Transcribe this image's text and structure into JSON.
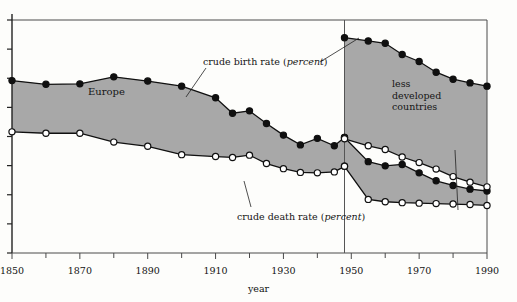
{
  "chart_data": {
    "type": "area",
    "title": "",
    "xlabel": "year",
    "ylabel": "",
    "xlim": [
      1850,
      1990
    ],
    "ylim": [
      0,
      5.0
    ],
    "grid": false,
    "legend_position": "inline-annotations",
    "x_ticks_major": [
      1850,
      1870,
      1890,
      1910,
      1930,
      1950,
      1970,
      1990
    ],
    "x_ticks_minor": [
      1860,
      1880,
      1900,
      1920,
      1940,
      1960,
      1980
    ],
    "y_ticks_count": 8,
    "divider_year": 1948,
    "annotations": [
      {
        "name": "crude-birth-rate-label",
        "text": "crude birth rate (percent)",
        "italic_part": "percent"
      },
      {
        "name": "crude-death-rate-label",
        "text": "crude death rate (percent)",
        "italic_part": "percent"
      },
      {
        "name": "europe-region-label",
        "text": "Europe"
      },
      {
        "name": "less-developed-countries-label",
        "text": "less developed countries"
      }
    ],
    "series": [
      {
        "name": "Europe crude birth rate",
        "marker": "filled-circle",
        "x": [
          1850,
          1860,
          1870,
          1880,
          1890,
          1900,
          1910,
          1915,
          1920,
          1925,
          1930,
          1935,
          1940,
          1945,
          1948
        ],
        "values": [
          3.7,
          3.62,
          3.63,
          3.78,
          3.69,
          3.58,
          3.33,
          3.0,
          3.05,
          2.78,
          2.53,
          2.32,
          2.46,
          2.3,
          2.48
        ]
      },
      {
        "name": "Europe crude death rate",
        "marker": "open-circle",
        "x": [
          1850,
          1860,
          1870,
          1880,
          1890,
          1900,
          1910,
          1915,
          1920,
          1925,
          1930,
          1935,
          1940,
          1945,
          1948
        ],
        "values": [
          2.6,
          2.57,
          2.57,
          2.38,
          2.29,
          2.11,
          2.07,
          2.05,
          2.1,
          1.92,
          1.81,
          1.73,
          1.72,
          1.74,
          1.86
        ]
      },
      {
        "name": "Europe crude birth rate (post-1948)",
        "marker": "filled-circle",
        "x": [
          1948,
          1955,
          1960,
          1965,
          1970,
          1975,
          1980,
          1985,
          1990
        ],
        "values": [
          2.48,
          1.96,
          1.87,
          1.9,
          1.72,
          1.55,
          1.45,
          1.37,
          1.33
        ]
      },
      {
        "name": "Europe crude death rate (post-1948)",
        "marker": "open-circle",
        "x": [
          1948,
          1955,
          1960,
          1965,
          1970,
          1975,
          1980,
          1985,
          1990
        ],
        "values": [
          1.86,
          1.15,
          1.1,
          1.08,
          1.07,
          1.06,
          1.05,
          1.04,
          1.02
        ]
      },
      {
        "name": "Less developed countries crude birth rate",
        "marker": "filled-circle",
        "x": [
          1948,
          1955,
          1960,
          1965,
          1970,
          1975,
          1980,
          1985,
          1990
        ],
        "values": [
          4.62,
          4.55,
          4.5,
          4.26,
          4.11,
          3.88,
          3.73,
          3.65,
          3.58
        ]
      },
      {
        "name": "Less developed countries crude death rate",
        "marker": "open-circle",
        "x": [
          1948,
          1955,
          1960,
          1965,
          1970,
          1975,
          1980,
          1985,
          1990
        ],
        "values": [
          2.45,
          2.3,
          2.22,
          2.06,
          1.94,
          1.8,
          1.64,
          1.52,
          1.42
        ]
      }
    ]
  },
  "labels": {
    "birth_rate_prefix": "crude birth rate (",
    "birth_rate_italic": "percent",
    "birth_rate_suffix": ")",
    "death_rate_prefix": "crude death rate (",
    "death_rate_italic": "percent",
    "death_rate_suffix": ")",
    "europe": "Europe",
    "ldc_line1": "less",
    "ldc_line2": "developed",
    "ldc_line3": "countries",
    "axis_year": "year"
  },
  "x_tick_labels": [
    "1850",
    "1870",
    "1890",
    "1910",
    "1930",
    "1950",
    "1970",
    "1990"
  ],
  "colors": {
    "shaded_area": "#a8a8a8",
    "line": "#101010",
    "axis": "#4a4a4a",
    "background": "#fdfdfb",
    "marker_fill_open": "#ffffff"
  }
}
